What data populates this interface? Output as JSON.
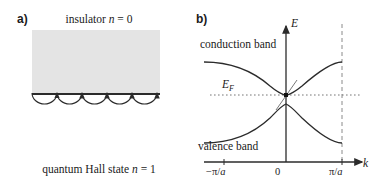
{
  "figure": {
    "panels": [
      {
        "id": "a",
        "label": "a)",
        "caption_top": "insulator n = 0",
        "caption_top_parts": {
          "text": "insulator",
          "symbol": "n",
          "equals": "= 0"
        },
        "caption_bottom": "quantum Hall state n = 1",
        "caption_bottom_parts": {
          "text": "quantum Hall state",
          "symbol": "n",
          "equals": "= 1"
        },
        "slab_fill": "#e4e4e4",
        "edge_orbit_count": 5,
        "orbit_direction": "rightward"
      },
      {
        "id": "b",
        "label": "b)",
        "y_axis_label": "E",
        "x_axis_label": "k",
        "fermi_label": "E",
        "fermi_subscript": "F",
        "conduction_band_label": "conduction band",
        "valence_band_label": "valence band",
        "x_ticks": [
          {
            "id": "left",
            "prefix": "−π/",
            "italic": "a"
          },
          {
            "id": "zero",
            "prefix": "0",
            "italic": ""
          },
          {
            "id": "right",
            "prefix": "π/",
            "italic": "a"
          }
        ],
        "gap_marker": "edge-state crossing at k = 0",
        "brillouin_boundary": "dashed line at pi/a"
      }
    ],
    "colors": {
      "ink": "#1a1a1a",
      "slab": "#e4e4e4",
      "curve": "#2b2b2b",
      "dotted": "#6b6b6b"
    }
  }
}
